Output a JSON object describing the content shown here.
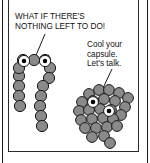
{
  "comic": {
    "panel_background": "#ffffff",
    "ink_color": "#1a1a1a",
    "blob_fill": "#8a8a8a",
    "blob_stroke": "#1a1a1a",
    "eye_white": "#ffffff",
    "pupil": "#000000",
    "captions": {
      "left": "WHAT IF THERE'S\nNOTHING LEFT TO DO!",
      "right": "Cool your\ncapsule.\nLet's talk."
    },
    "characters": [
      {
        "name": "arch-creature",
        "description": "chain of circles forming an upside-down U with two eyes and angry eyebrows",
        "bead_count": 15,
        "eyes": 2,
        "eyebrows": 2
      },
      {
        "name": "cluster-creature",
        "description": "dense clustered blob of circles with two eyes",
        "bead_count": 26,
        "eyes": 2,
        "eyebrows": 0
      }
    ],
    "pointer_lines": [
      {
        "name": "left-pointer",
        "from": "left caption",
        "to": "arch-creature"
      },
      {
        "name": "right-pointer",
        "from": "right caption",
        "to": "cluster-creature"
      }
    ]
  }
}
